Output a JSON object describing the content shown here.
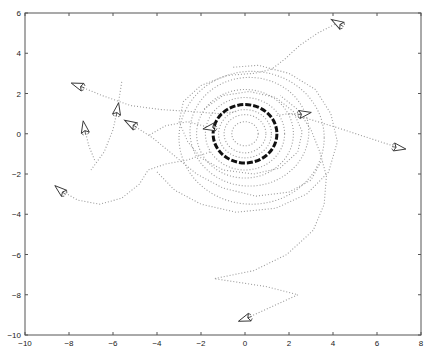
{
  "chart_data": {
    "type": "scatter",
    "title": "",
    "xlabel": "",
    "ylabel": "",
    "xlim": [
      -10,
      8
    ],
    "ylim": [
      -10,
      6
    ],
    "xticks": [
      -10,
      -8,
      -6,
      -4,
      -2,
      0,
      2,
      4,
      6,
      8
    ],
    "yticks": [
      -10,
      -8,
      -6,
      -4,
      -2,
      0,
      2,
      4,
      6
    ],
    "grid": false,
    "legend": null,
    "plot_box_px": {
      "left": 25,
      "top": 13,
      "right": 421,
      "bottom": 335
    },
    "colors": {
      "trajectory": "#9a9a9a",
      "ring": "#111111",
      "axis": "#555555",
      "agent": "#333333"
    },
    "center_rings": [
      {
        "cx": 0,
        "cy": 0,
        "r": 1.45,
        "style": "dense"
      },
      {
        "cx": 0,
        "cy": 0,
        "r": 0.6,
        "style": "dotted"
      },
      {
        "cx": 0,
        "cy": 0,
        "r": 0.95,
        "style": "dotted"
      },
      {
        "cx": 0,
        "cy": 0,
        "r": 1.2,
        "style": "dotted"
      },
      {
        "cx": 0,
        "cy": 0,
        "r": 1.8,
        "style": "dotted"
      },
      {
        "cx": 0,
        "cy": 0,
        "r": 2.2,
        "style": "dotted"
      },
      {
        "cx": 0.2,
        "cy": 0.1,
        "r": 2.7,
        "style": "dotted"
      },
      {
        "cx": 0.3,
        "cy": -0.2,
        "r": 3.3,
        "style": "dotted"
      }
    ],
    "agents": [
      {
        "x": 4.2,
        "y": 5.5,
        "heading": 150
      },
      {
        "x": -7.6,
        "y": 2.4,
        "heading": 160
      },
      {
        "x": -7.3,
        "y": 0.3,
        "heading": 100
      },
      {
        "x": -5.8,
        "y": 1.2,
        "heading": 80
      },
      {
        "x": -5.2,
        "y": 0.5,
        "heading": 150
      },
      {
        "x": -1.6,
        "y": 0.3,
        "heading": 190
      },
      {
        "x": 2.7,
        "y": 1.0,
        "heading": 10
      },
      {
        "x": 7.0,
        "y": -0.7,
        "heading": 350
      },
      {
        "x": -8.4,
        "y": -2.8,
        "heading": 140
      },
      {
        "x": 0.0,
        "y": -9.2,
        "heading": 200
      }
    ],
    "trajectories": [
      [
        [
          4.2,
          5.5
        ],
        [
          3.3,
          5.0
        ],
        [
          2.5,
          4.4
        ],
        [
          1.8,
          3.7
        ],
        [
          1.2,
          3.2
        ],
        [
          0.4,
          3.0
        ],
        [
          -0.8,
          2.9
        ],
        [
          -2.0,
          2.4
        ],
        [
          -2.8,
          1.6
        ],
        [
          -3.0,
          0.6
        ]
      ],
      [
        [
          -7.6,
          2.4
        ],
        [
          -6.5,
          1.9
        ],
        [
          -5.2,
          1.4
        ],
        [
          -3.8,
          1.2
        ],
        [
          -2.4,
          1.1
        ],
        [
          -1.2,
          1.0
        ],
        [
          -0.4,
          1.1
        ]
      ],
      [
        [
          -7.3,
          0.3
        ],
        [
          -7.1,
          -0.6
        ],
        [
          -6.8,
          -1.4
        ]
      ],
      [
        [
          -5.8,
          1.2
        ],
        [
          -5.7,
          1.9
        ],
        [
          -5.6,
          2.6
        ]
      ],
      [
        [
          -5.8,
          1.2
        ],
        [
          -6.0,
          0.2
        ],
        [
          -6.4,
          -0.9
        ],
        [
          -7.0,
          -1.8
        ]
      ],
      [
        [
          -5.2,
          0.5
        ],
        [
          -4.2,
          -0.2
        ],
        [
          -3.2,
          -1.1
        ],
        [
          -2.2,
          -2.0
        ],
        [
          -1.0,
          -2.7
        ],
        [
          0.5,
          -3.1
        ],
        [
          2.0,
          -2.9
        ],
        [
          3.0,
          -2.3
        ],
        [
          3.5,
          -1.3
        ]
      ],
      [
        [
          -8.4,
          -2.8
        ],
        [
          -7.6,
          -3.3
        ],
        [
          -6.6,
          -3.5
        ],
        [
          -5.6,
          -3.2
        ],
        [
          -4.8,
          -2.5
        ],
        [
          -4.4,
          -1.8
        ],
        [
          -3.6,
          -1.5
        ],
        [
          -2.6,
          -1.3
        ],
        [
          -1.6,
          -0.9
        ]
      ],
      [
        [
          -1.6,
          0.3
        ],
        [
          -2.6,
          0.6
        ],
        [
          -3.6,
          0.4
        ],
        [
          -4.4,
          -0.1
        ]
      ],
      [
        [
          2.7,
          1.0
        ],
        [
          2.0,
          1.0
        ],
        [
          1.4,
          0.9
        ]
      ],
      [
        [
          7.0,
          -0.7
        ],
        [
          5.6,
          -0.2
        ],
        [
          4.2,
          0.3
        ],
        [
          3.0,
          0.7
        ],
        [
          2.0,
          1.0
        ]
      ],
      [
        [
          0.0,
          -9.2
        ],
        [
          1.2,
          -8.6
        ],
        [
          2.4,
          -8.0
        ],
        [
          1.0,
          -7.6
        ],
        [
          -1.4,
          -7.2
        ],
        [
          0.4,
          -6.8
        ],
        [
          1.9,
          -6.0
        ],
        [
          3.1,
          -4.8
        ],
        [
          3.6,
          -3.5
        ],
        [
          3.7,
          -2.1
        ],
        [
          3.4,
          -0.9
        ],
        [
          3.0,
          0.2
        ],
        [
          2.4,
          1.2
        ],
        [
          1.6,
          1.9
        ]
      ],
      [
        [
          -3.0,
          0.6
        ],
        [
          -2.6,
          -0.4
        ],
        [
          -2.0,
          -1.2
        ],
        [
          -1.0,
          -1.8
        ],
        [
          0.4,
          -2.0
        ],
        [
          1.6,
          -1.7
        ],
        [
          2.4,
          -0.9
        ],
        [
          2.6,
          0.1
        ],
        [
          2.2,
          1.1
        ],
        [
          1.4,
          1.8
        ],
        [
          0.2,
          2.1
        ],
        [
          -1.0,
          1.9
        ],
        [
          -1.9,
          1.2
        ]
      ],
      [
        [
          -4.0,
          -1.9
        ],
        [
          -3.2,
          -2.8
        ],
        [
          -2.0,
          -3.5
        ],
        [
          -0.4,
          -3.9
        ],
        [
          1.4,
          -3.7
        ],
        [
          2.8,
          -3.0
        ],
        [
          3.8,
          -1.9
        ],
        [
          4.2,
          -0.4
        ],
        [
          3.9,
          1.0
        ],
        [
          3.2,
          2.2
        ],
        [
          2.0,
          3.0
        ],
        [
          0.6,
          3.4
        ],
        [
          -0.6,
          3.3
        ]
      ]
    ]
  }
}
